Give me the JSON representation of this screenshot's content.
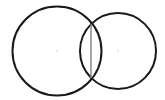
{
  "diagram": {
    "background": "#ffffff",
    "circles": [
      {
        "id": "left-circle",
        "cx": 57,
        "cy": 51,
        "r": 44.5,
        "stroke": "#1a1a1a",
        "stroke_width": 2
      },
      {
        "id": "right-circle",
        "cx": 118,
        "cy": 51,
        "r": 38,
        "stroke": "#1a1a1a",
        "stroke_width": 2
      }
    ],
    "center_points": [
      {
        "id": "left-center",
        "x": 57,
        "y": 51,
        "color": "#cccccc"
      },
      {
        "id": "right-center",
        "x": 118,
        "y": 51,
        "color": "#cccccc"
      }
    ],
    "chord": {
      "x1": 91,
      "y1": 24,
      "x2": 91,
      "y2": 78,
      "stroke": "#888888",
      "stroke_width": 1.5
    }
  }
}
